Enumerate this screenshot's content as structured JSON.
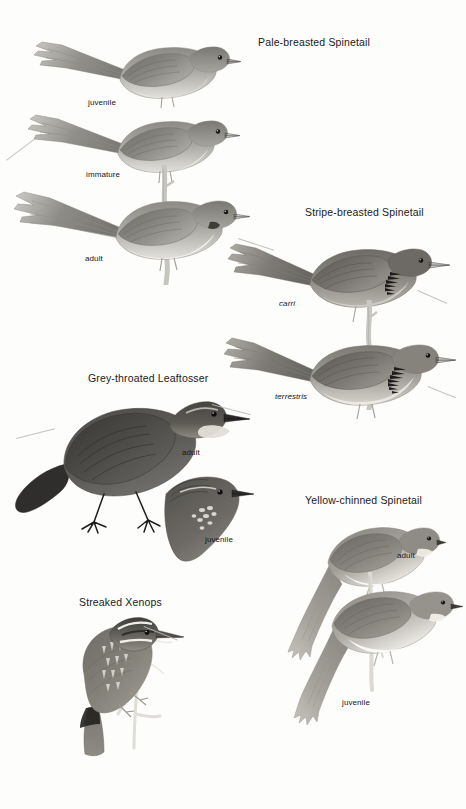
{
  "page": {
    "kind": "field-guide-plate",
    "background_color": "#fdfdfc",
    "ink_color": "#1b1b1b",
    "width": 466,
    "height": 809
  },
  "species": [
    {
      "id": "pale-breasted-spinetail",
      "common_name": "Pale-breasted Spinetail",
      "title_x": 258,
      "title_y": 36,
      "figures": [
        {
          "label": "juvenile",
          "label_kind": "plumage",
          "label_x": 88,
          "label_y": 98
        },
        {
          "label": "immature",
          "label_kind": "plumage",
          "label_x": 86,
          "label_y": 170
        },
        {
          "label": "adult",
          "label_kind": "plumage",
          "label_x": 85,
          "label_y": 254
        }
      ]
    },
    {
      "id": "stripe-breasted-spinetail",
      "common_name": "Stripe-breasted Spinetail",
      "title_x": 305,
      "title_y": 206,
      "figures": [
        {
          "label": "carri",
          "label_kind": "subspecies",
          "label_x": 279,
          "label_y": 299
        },
        {
          "label": "terrestris",
          "label_kind": "subspecies",
          "label_x": 275,
          "label_y": 392
        }
      ]
    },
    {
      "id": "grey-throated-leaftosser",
      "common_name": "Grey-throated Leaftosser",
      "title_x": 88,
      "title_y": 372,
      "figures": [
        {
          "label": "adult",
          "label_kind": "plumage",
          "label_x": 182,
          "label_y": 448
        },
        {
          "label": "juvenile",
          "label_kind": "plumage",
          "label_x": 205,
          "label_y": 535
        }
      ]
    },
    {
      "id": "yellow-chinned-spinetail",
      "common_name": "Yellow-chinned Spinetail",
      "title_x": 305,
      "title_y": 494,
      "figures": [
        {
          "label": "adult",
          "label_kind": "plumage",
          "label_x": 397,
          "label_y": 551
        },
        {
          "label": "juvenile",
          "label_kind": "plumage",
          "label_x": 342,
          "label_y": 698
        }
      ]
    },
    {
      "id": "streaked-xenops",
      "common_name": "Streaked Xenops",
      "title_x": 79,
      "title_y": 596,
      "figures": []
    }
  ]
}
